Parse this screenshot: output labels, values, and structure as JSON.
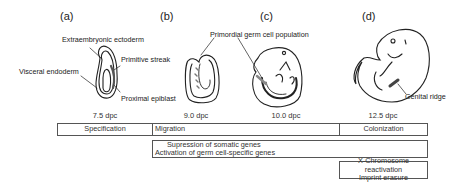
{
  "panels": [
    {
      "id": "a",
      "label": "(a)",
      "stage": "7.5 dpc"
    },
    {
      "id": "b",
      "label": "(b)",
      "stage": "9.0 dpc"
    },
    {
      "id": "c",
      "label": "(c)",
      "stage": "10.0 dpc"
    },
    {
      "id": "d",
      "label": "(d)",
      "stage": "12.5 dpc"
    }
  ],
  "annotations": {
    "extraembryonic_ectoderm": "Extraembryonic ectoderm",
    "primitive_streak": "Primitive streak",
    "visceral_endoderm": "Visceral endoderm",
    "proximal_epiblast": "Proximal epiblast",
    "primordial_germ_cell_population": "Primordial germ cell population",
    "genital_ridge": "Genital ridge"
  },
  "timeline": {
    "phases": [
      {
        "label": "Specification"
      },
      {
        "label": "Migration"
      },
      {
        "label": "Colonization"
      }
    ],
    "gene_program": {
      "line1": "Supression of somatic genes",
      "line2": "Activation of germ cell-specific genes"
    },
    "epigenetic": {
      "line1": "X-Chromosome reactivation",
      "line2": "Imprint erasure"
    }
  }
}
